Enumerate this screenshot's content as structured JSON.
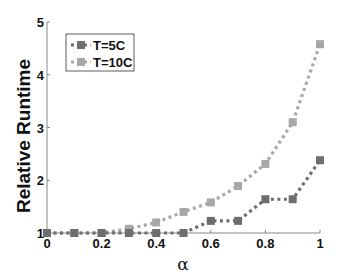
{
  "chart_data": {
    "type": "line",
    "title": "",
    "xlabel": "α",
    "ylabel": "Relative Runtime",
    "xlim": [
      0,
      1
    ],
    "ylim": [
      1,
      5
    ],
    "x_ticks": [
      "0",
      "0.2",
      "0.4",
      "0.6",
      "0.8",
      "1"
    ],
    "y_ticks": [
      "1",
      "2",
      "3",
      "4",
      "5"
    ],
    "grid": false,
    "legend_position": "upper-left",
    "x": [
      0,
      0.1,
      0.2,
      0.3,
      0.4,
      0.5,
      0.6,
      0.7,
      0.8,
      0.9,
      1.0
    ],
    "series": [
      {
        "name": "T=5C",
        "color": "#6e6e6e",
        "line_style": "dotted",
        "marker": "square",
        "values": [
          1.0,
          1.0,
          1.0,
          1.0,
          1.0,
          1.0,
          1.23,
          1.23,
          1.64,
          1.64,
          2.38
        ]
      },
      {
        "name": "T=10C",
        "color": "#a8a8a8",
        "line_style": "dotted",
        "marker": "square",
        "values": [
          1.0,
          1.0,
          1.0,
          1.08,
          1.2,
          1.4,
          1.58,
          1.89,
          2.31,
          3.1,
          4.58
        ]
      }
    ]
  },
  "axis_color": "#888888"
}
